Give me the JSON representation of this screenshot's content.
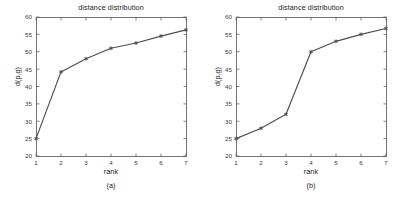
{
  "figure": {
    "background": "#ffffff",
    "line_color": "#4d4d4d",
    "axis_color": "#666666",
    "text_color": "#1a1a1a"
  },
  "panels": [
    {
      "caption": "(a)",
      "chart_data": {
        "type": "line",
        "title": "distance distribution",
        "xlabel": "rank",
        "ylabel": "d(p,g)",
        "x": [
          1,
          2,
          3,
          4,
          5,
          6,
          7
        ],
        "values": [
          25.0,
          44.2,
          48.0,
          51.0,
          52.5,
          54.5,
          56.3
        ],
        "xlim": [
          1,
          7
        ],
        "ylim": [
          20,
          60
        ],
        "xticks": [
          1,
          2,
          3,
          4,
          5,
          6,
          7
        ],
        "yticks": [
          20,
          25,
          30,
          35,
          40,
          45,
          50,
          55,
          60
        ],
        "xticklabels": [
          "1",
          "2",
          "3",
          "4",
          "5",
          "6",
          "7"
        ],
        "yticklabels": [
          "20",
          "25",
          "30",
          "35",
          "40",
          "45",
          "50",
          "55",
          "60"
        ],
        "grid": false,
        "legend": null,
        "marker": "asterisk",
        "series": [
          {
            "name": "d(p,g)",
            "values": [
              25.0,
              44.2,
              48.0,
              51.0,
              52.5,
              54.5,
              56.3
            ]
          }
        ]
      }
    },
    {
      "caption": "(b)",
      "chart_data": {
        "type": "line",
        "title": "distance distribution",
        "xlabel": "rank",
        "ylabel": "d(p,g)",
        "x": [
          1,
          2,
          3,
          4,
          5,
          6,
          7
        ],
        "values": [
          25.0,
          28.0,
          32.0,
          50.0,
          53.0,
          55.0,
          56.7
        ],
        "xlim": [
          1,
          7
        ],
        "ylim": [
          20,
          60
        ],
        "xticks": [
          1,
          2,
          3,
          4,
          5,
          6,
          7
        ],
        "yticks": [
          20,
          25,
          30,
          35,
          40,
          45,
          50,
          55,
          60
        ],
        "xticklabels": [
          "1",
          "2",
          "3",
          "4",
          "5",
          "6",
          "7"
        ],
        "yticklabels": [
          "20",
          "25",
          "30",
          "35",
          "40",
          "45",
          "50",
          "55",
          "60"
        ],
        "grid": false,
        "legend": null,
        "marker": "asterisk",
        "series": [
          {
            "name": "d(p,g)",
            "values": [
              25.0,
              28.0,
              32.0,
              50.0,
              53.0,
              55.0,
              56.7
            ]
          }
        ]
      }
    }
  ]
}
